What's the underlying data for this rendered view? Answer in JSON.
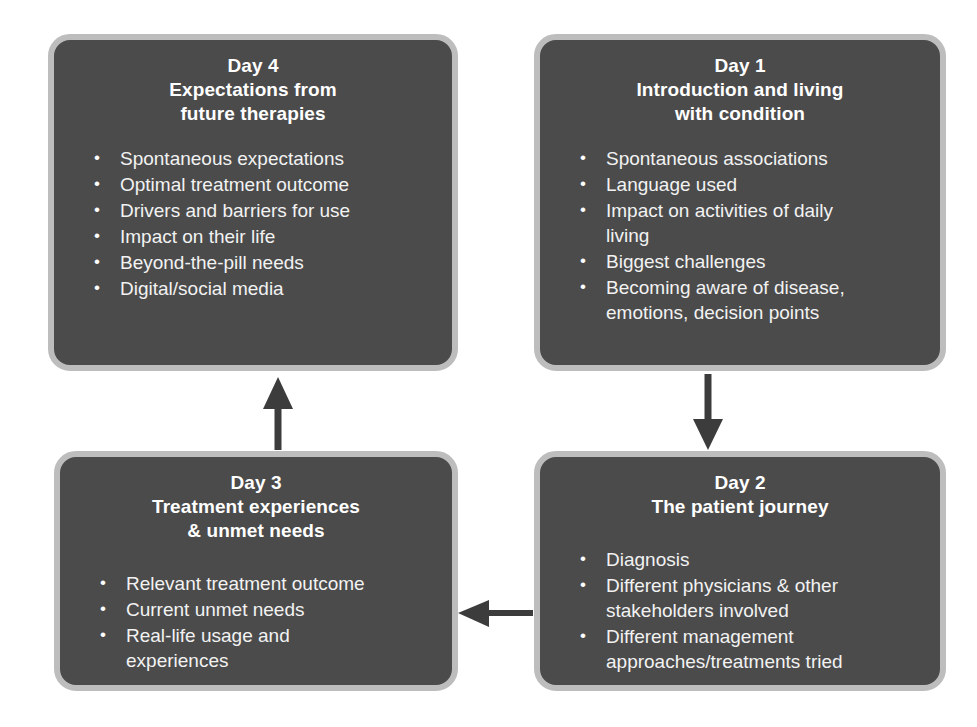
{
  "diagram": {
    "background_color": "#ffffff",
    "card_fill_color": "#4b4b4b",
    "card_border_color": "#bdbdbd",
    "card_text_color": "#ffffff",
    "arrow_color": "#3c3c3c",
    "cards": [
      {
        "id": "day4",
        "day": "Day 4",
        "heading": "Expectations from\nfuture therapies",
        "title": "Day 4\nExpectations from\nfuture therapies",
        "bullets": [
          "Spontaneous expectations",
          "Optimal treatment outcome",
          "Drivers and barriers for use",
          "Impact on their life",
          "Beyond-the-pill needs",
          "Digital/social media"
        ]
      },
      {
        "id": "day1",
        "day": "Day 1",
        "heading": "Introduction and living\nwith condition",
        "title": "Day 1\nIntroduction and living\nwith condition",
        "bullets": [
          "Spontaneous associations",
          "Language used",
          "Impact on activities of daily\nliving",
          "Biggest challenges",
          "Becoming aware of disease,\nemotions, decision points"
        ]
      },
      {
        "id": "day3",
        "day": "Day 3",
        "heading": "Treatment experiences\n& unmet needs",
        "title": "Day 3\nTreatment experiences\n& unmet needs",
        "bullets": [
          "Relevant treatment outcome",
          "Current unmet needs",
          "Real-life usage and\nexperiences"
        ]
      },
      {
        "id": "day2",
        "day": "Day 2",
        "heading": "The patient journey",
        "title": "Day 2\nThe patient journey",
        "bullets": [
          "Diagnosis",
          "Different physicians & other\nstakeholders involved",
          "Different management\napproaches/treatments tried"
        ]
      }
    ],
    "arrows": [
      {
        "id": "day1-to-day2",
        "from": "day1",
        "to": "day2",
        "direction": "down"
      },
      {
        "id": "day2-to-day3",
        "from": "day2",
        "to": "day3",
        "direction": "left"
      },
      {
        "id": "day3-to-day4",
        "from": "day3",
        "to": "day4",
        "direction": "up"
      }
    ]
  }
}
